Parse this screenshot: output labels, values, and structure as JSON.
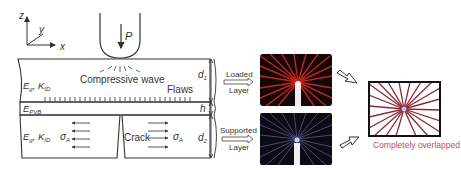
{
  "axes": {
    "z": "z",
    "y": "y",
    "x": "x"
  },
  "indenter": {
    "load_label": "P"
  },
  "top_layer": {
    "material_label": "E",
    "material_sub": "g",
    "toughness_label": "K",
    "toughness_sub": "ID",
    "wave_label": "Compressive wave",
    "flaws_label": "Flaws",
    "thickness_label": "d",
    "thickness_sub": "1"
  },
  "interlayer": {
    "material_label": "E",
    "material_sub": "PVB",
    "thickness_label": "h"
  },
  "bottom_layer": {
    "material_label": "E",
    "material_sub": "g",
    "toughness_label": "K",
    "toughness_sub": "ID",
    "stress_label": "σ",
    "stress_sub": "A",
    "crack_label": "Crack",
    "thickness_label": "d",
    "thickness_sub": "2"
  },
  "arrows": {
    "loaded_top": "Loaded",
    "loaded_bottom": "Layer",
    "supported_top": "Supported",
    "supported_bottom": "Layer"
  },
  "result": {
    "caption": "Completely overlapped",
    "caption_color": "#c0505a",
    "loaded_ray_color": "#d42a1e",
    "supported_ray_color": "#8a90d8",
    "overlap_ray_color": "#8b2a35"
  }
}
